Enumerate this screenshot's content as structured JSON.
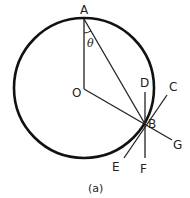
{
  "diagram": {
    "caption": "(a)",
    "angle_label": "θ",
    "points": {
      "A": "A",
      "O": "O",
      "B": "B",
      "C": "C",
      "D": "D",
      "E": "E",
      "F": "F",
      "G": "G"
    },
    "colors": {
      "stroke": "#111111",
      "background": "#ffffff"
    }
  }
}
